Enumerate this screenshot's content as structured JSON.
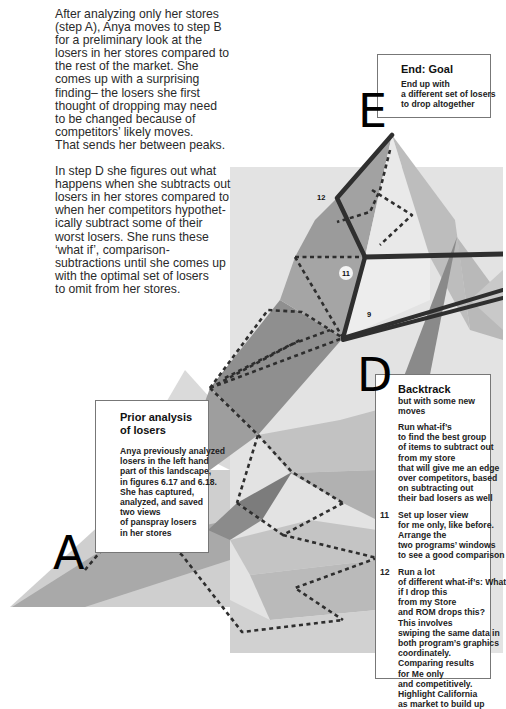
{
  "intro": {
    "paragraph1_lines": [
      "After analyzing only her stores",
      "(step A), Anya moves to step B",
      "for a preliminary look at the",
      "losers in her stores compared to",
      "the rest of the market. She",
      "comes up with a surprising",
      "finding– the losers she first",
      "thought of dropping may need",
      "to be changed because of",
      "competitors’ likely moves.",
      "That sends her between peaks."
    ],
    "paragraph2_lines": [
      "In step D she figures out what",
      "happens when she subtracts out",
      "losers in her stores compared to",
      "when her competitors hypothet-",
      "ically subtract some of their",
      "worst losers. She runs these",
      "‘what if’, comparison-",
      "subtractions until she comes up",
      "with the optimal set of losers",
      "to omit from her stores."
    ]
  },
  "step_letters": {
    "A": "A",
    "D": "D",
    "E": "E"
  },
  "path_labels": {
    "n12": "12",
    "n11": "11",
    "n9": "9"
  },
  "goal_box": {
    "title": "End: Goal",
    "lines": [
      "End up with",
      "a different set of losers",
      "to drop altogether"
    ]
  },
  "prior_box": {
    "title_lines": [
      "Prior analysis",
      "of losers"
    ],
    "lines": [
      "Anya previously analyzed",
      "losers in the left hand",
      "part of this landscape,",
      "in figures 6.17 and 6.18.",
      "She has captured,",
      "analyzed, and saved",
      "two views",
      "of panspray losers",
      "in her stores"
    ]
  },
  "backtrack_box": {
    "title": "Backtrack",
    "subtitle": "but with some new moves",
    "intro_lines": [
      "Run what-if’s",
      "to find the best group",
      "of items to subtract out",
      "from my store",
      "that will give me an edge",
      "over competitors, based",
      "on subtracting out",
      "their bad losers as well"
    ],
    "steps": [
      {
        "num": "11",
        "lines": [
          "Set up loser view",
          "for me only, like before.",
          "Arrange the",
          "two programs’ windows",
          "to see a good comparison"
        ]
      },
      {
        "num": "12",
        "lines": [
          "Run a lot",
          "of different what-if’s: What",
          "if I drop this",
          "from my Store",
          "and ROM drops this?",
          "This involves",
          "swiping the same data in",
          "both program’s graphics",
          "coordinately.",
          "Comparing results",
          "for Me only",
          "and competitively.",
          "Highlight California",
          "as market to build up"
        ]
      }
    ]
  },
  "colors": {
    "background_panel": "#e2e2e2",
    "facet_light": "#d4d4d4",
    "facet_mid": "#b3b3b3",
    "facet_dark": "#8e8e8e",
    "facet_darkest": "#757575",
    "path": "#333333"
  }
}
